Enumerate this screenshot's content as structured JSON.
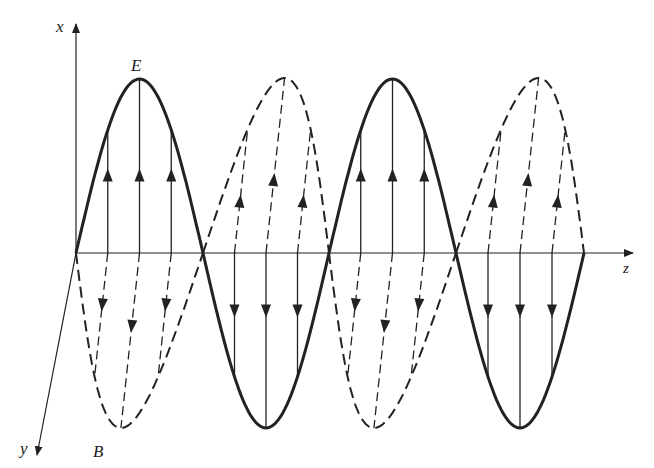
{
  "figure": {
    "axes": {
      "x_label": "x",
      "y_label": "y",
      "z_label": "z"
    },
    "curve_labels": {
      "electric": "E",
      "magnetic": "B"
    },
    "colors": {
      "stroke": "#222222",
      "background": "#ffffff"
    },
    "geometry": {
      "origin": [
        76,
        253
      ],
      "half_period_px": 127,
      "crossings_x": [
        76,
        203,
        329,
        456,
        584
      ],
      "e_peak_y": 79,
      "e_trough_y": 428,
      "z_axis_end_x": 633,
      "x_axis_top_y": 24,
      "y_axis_end": [
        37,
        455
      ]
    },
    "e_lobes": [
      {
        "start": 76,
        "end": 203,
        "dir": "up"
      },
      {
        "start": 203,
        "end": 329,
        "dir": "down"
      },
      {
        "start": 329,
        "end": 456,
        "dir": "up"
      },
      {
        "start": 456,
        "end": 584,
        "dir": "down"
      }
    ],
    "b_lobes": [
      {
        "start": 76,
        "end": 203,
        "dir": "down",
        "style": "dashed"
      },
      {
        "start": 203,
        "end": 329,
        "dir": "up",
        "style": "dashed"
      },
      {
        "start": 329,
        "end": 456,
        "dir": "down",
        "style": "dashed"
      },
      {
        "start": 456,
        "end": 584,
        "dir": "up",
        "style": "dashed"
      }
    ]
  }
}
